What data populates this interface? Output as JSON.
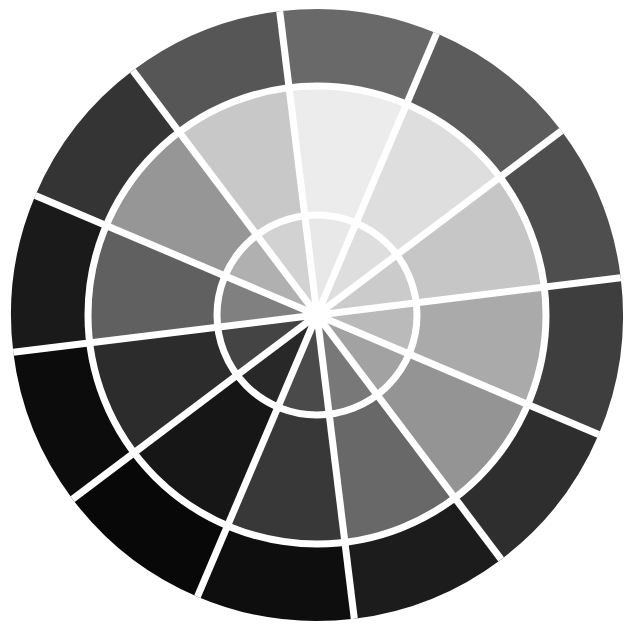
{
  "figure": {
    "kind": "radial-segmented-disc",
    "background_color": "#FFFFFF",
    "separator_color": "#FFFFFF",
    "separator_width_px": 7,
    "center": {
      "x": 317,
      "y": 315
    },
    "hub": {
      "radius_px": 13,
      "color": "#FFFFFF"
    },
    "sector_count": 12,
    "ring_count": 3,
    "sector_angle_deg": 30,
    "start_angle_deg": -97,
    "rings": [
      {
        "name": "inner-ring",
        "inner_radius_px": 13,
        "outer_radius_px": 100
      },
      {
        "name": "middle-ring",
        "inner_radius_px": 100,
        "outer_radius_px": 229
      },
      {
        "name": "outer-ring",
        "inner_radius_px": 229,
        "outer_radius_px": 306
      }
    ]
  },
  "chart_data": {
    "type": "pie",
    "subtitle": "",
    "xlabel": "",
    "ylabel": "",
    "legend_position": "none",
    "grid": false,
    "categories": [
      "sector-01",
      "sector-02",
      "sector-03",
      "sector-04",
      "sector-05",
      "sector-06",
      "sector-07",
      "sector-08",
      "sector-09",
      "sector-10",
      "sector-11",
      "sector-12"
    ],
    "values": [
      30,
      30,
      30,
      30,
      30,
      30,
      30,
      30,
      30,
      30,
      30,
      30
    ],
    "series": [
      {
        "name": "inner-ring",
        "values": [
          232,
          222,
          203,
          186,
          162,
          120,
          74,
          40,
          68,
          128,
          176,
          210
        ],
        "colors": [
          "#E8E8E8",
          "#DEDEDE",
          "#CBCBCB",
          "#BABABA",
          "#A2A2A2",
          "#787878",
          "#4A4A4A",
          "#282828",
          "#444444",
          "#808080",
          "#B0B0B0",
          "#D2D2D2"
        ]
      },
      {
        "name": "middle-ring",
        "values": [
          236,
          222,
          198,
          170,
          148,
          104,
          56,
          22,
          44,
          96,
          150,
          200
        ],
        "colors": [
          "#ECECEC",
          "#DEDEDE",
          "#C6C6C6",
          "#AAAAAA",
          "#949494",
          "#686868",
          "#383838",
          "#161616",
          "#2C2C2C",
          "#606060",
          "#969696",
          "#C8C8C8"
        ]
      },
      {
        "name": "outer-ring",
        "values": [
          105,
          92,
          78,
          62,
          46,
          28,
          14,
          8,
          12,
          26,
          52,
          86
        ],
        "colors": [
          "#696969",
          "#5C5C5C",
          "#4E4E4E",
          "#3E3E3E",
          "#2E2E2E",
          "#1C1C1C",
          "#0E0E0E",
          "#080808",
          "#0C0C0C",
          "#1A1A1A",
          "#343434",
          "#565656"
        ]
      }
    ],
    "value_range": [
      8,
      236
    ]
  }
}
